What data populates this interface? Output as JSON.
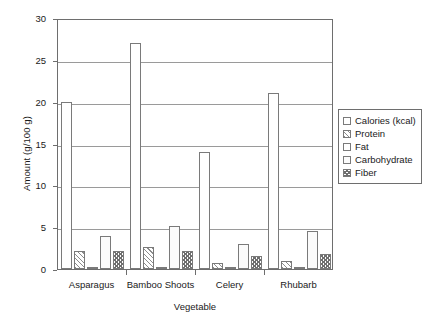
{
  "chart_data": {
    "type": "bar",
    "title": "",
    "xlabel": "Vegetable",
    "ylabel": "Amount (g/100 g)",
    "ylim": [
      0,
      30
    ],
    "yticks": [
      0,
      5,
      10,
      15,
      20,
      25,
      30
    ],
    "ytick_labels": [
      "0",
      "5",
      "10",
      "15",
      "20",
      "25",
      "30"
    ],
    "grid": true,
    "legend_position": "right",
    "categories": [
      "Asparagus",
      "Bamboo Shoots",
      "Celery",
      "Rhubarb"
    ],
    "series": [
      {
        "name": "Calories (kcal)",
        "pattern": "fine-dots",
        "values": [
          20.0,
          27.0,
          14.0,
          21.0
        ]
      },
      {
        "name": "Protein",
        "pattern": "diagonal-hatch",
        "values": [
          2.2,
          2.6,
          0.7,
          0.9
        ]
      },
      {
        "name": "Fat",
        "pattern": "solid-white",
        "values": [
          0.1,
          0.3,
          0.2,
          0.2
        ]
      },
      {
        "name": "Carbohydrate",
        "pattern": "light-dots",
        "values": [
          4.0,
          5.2,
          3.0,
          4.5
        ]
      },
      {
        "name": "Fiber",
        "pattern": "cross-hatch",
        "values": [
          2.1,
          2.2,
          1.6,
          1.8
        ]
      }
    ]
  },
  "colors": {
    "axis": "#6e6e6e",
    "grid": "#9a9a9a",
    "text": "#1a1a1a",
    "plot_background": "#ffffff"
  }
}
